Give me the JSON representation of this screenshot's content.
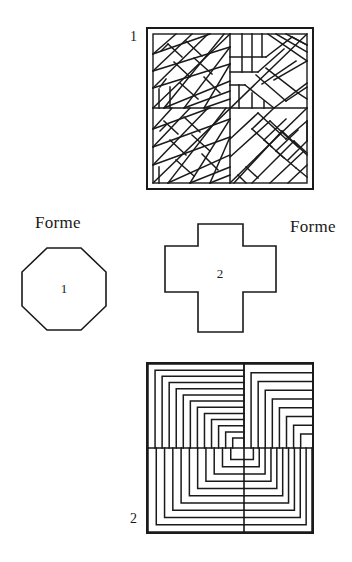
{
  "page": {
    "width": 352,
    "height": 562,
    "background_color": "#ffffff",
    "ink_color": "#1a1a1a"
  },
  "labels": {
    "forme_left": "Forme",
    "forme_right": "Forme"
  },
  "figures": [
    {
      "id": "figure-1",
      "number": "1",
      "caption_position": "top-left",
      "kind": "tiling-pattern",
      "pattern_name": "herringbone-parquet",
      "bounds": {
        "x": 146,
        "y": 27,
        "width": 168,
        "height": 163
      },
      "description": "Square frame filled with diagonal herringbone parquet bands of elongated rectangles meeting along a diagonal seam."
    },
    {
      "id": "figure-2",
      "number": "2",
      "caption_position": "bottom-left",
      "kind": "tiling-pattern",
      "pattern_name": "nested-L-quadrants",
      "bounds": {
        "x": 146,
        "y": 362,
        "width": 168,
        "height": 172
      },
      "description": "Square frame divided into four quadrants, each filled with concentric nested right-angle L shapes.",
      "quadrants": [
        {
          "name": "top-left",
          "corner": "top-left",
          "bands": 13
        },
        {
          "name": "top-right",
          "corner": "top-left",
          "bands": 9
        },
        {
          "name": "bottom-left",
          "corner": "bottom-left",
          "bands": 11
        },
        {
          "name": "bottom-right",
          "corner": "bottom-right",
          "bands": 11
        }
      ]
    }
  ],
  "shapes": [
    {
      "id": "shape-1",
      "number": "1",
      "name": "octagon",
      "sides": 8,
      "bounds": {
        "x": 20,
        "y": 246,
        "width": 88,
        "height": 86
      }
    },
    {
      "id": "shape-2",
      "number": "2",
      "name": "greek-cross",
      "sides": 12,
      "bounds": {
        "x": 163,
        "y": 222,
        "width": 115,
        "height": 112
      }
    }
  ]
}
